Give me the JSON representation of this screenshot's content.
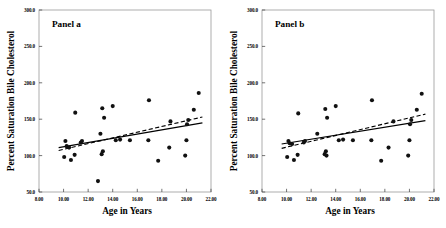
{
  "figure": {
    "background": "#ffffff",
    "point_color": "#111111",
    "frame_color": "#9a9a9a"
  },
  "chart_data": [
    {
      "type": "scatter",
      "title": "Panel a",
      "xlabel": "Age in Years",
      "ylabel": "Percent Saturation Bile Cholesterol",
      "xlim": [
        8.0,
        22.0
      ],
      "ylim": [
        50.0,
        300.0
      ],
      "xticks": [
        8.0,
        10.0,
        12.0,
        14.0,
        16.0,
        18.0,
        20.0,
        22.0
      ],
      "xtick_labels": [
        "8.00",
        "10.00",
        "12.00",
        "14.00",
        "16.00",
        "18.00",
        "20.00",
        "22.00"
      ],
      "yticks": [
        50.0,
        100.0,
        150.0,
        200.0,
        250.0,
        300.0
      ],
      "ytick_labels": [
        "50.0",
        "100.0",
        "150.0",
        "200.0",
        "250.0",
        "300.0"
      ],
      "grid": false,
      "legend": "none",
      "points": [
        [
          10.05,
          98
        ],
        [
          10.15,
          120
        ],
        [
          10.25,
          113
        ],
        [
          10.45,
          111
        ],
        [
          10.6,
          94
        ],
        [
          10.9,
          101
        ],
        [
          10.95,
          159
        ],
        [
          11.4,
          118
        ],
        [
          11.5,
          120
        ],
        [
          12.8,
          65
        ],
        [
          13.0,
          130
        ],
        [
          13.1,
          102
        ],
        [
          13.15,
          165
        ],
        [
          13.2,
          106
        ],
        [
          13.3,
          152
        ],
        [
          14.0,
          168
        ],
        [
          14.25,
          121
        ],
        [
          14.6,
          122
        ],
        [
          15.4,
          121
        ],
        [
          16.9,
          121
        ],
        [
          16.95,
          176
        ],
        [
          17.7,
          93
        ],
        [
          18.6,
          111
        ],
        [
          18.7,
          147
        ],
        [
          19.9,
          100
        ],
        [
          20.0,
          121
        ],
        [
          20.05,
          143
        ],
        [
          20.15,
          149
        ],
        [
          20.6,
          163
        ],
        [
          21.0,
          186
        ]
      ],
      "fit_solid": {
        "style": "solid",
        "x": [
          9.6,
          21.3
        ],
        "y": [
          111,
          145
        ]
      },
      "fit_dashed": {
        "style": "dashed",
        "x": [
          9.6,
          21.3
        ],
        "y": [
          107,
          153
        ]
      }
    },
    {
      "type": "scatter",
      "title": "Panel b",
      "xlabel": "Age in Years",
      "ylabel": "Percent Saturation Bile Cholesterol",
      "xlim": [
        8.0,
        22.0
      ],
      "ylim": [
        50.0,
        300.0
      ],
      "xticks": [
        8.0,
        10.0,
        12.0,
        14.0,
        16.0,
        18.0,
        20.0,
        22.0
      ],
      "xtick_labels": [
        "8.00",
        "10.00",
        "12.00",
        "14.00",
        "16.00",
        "18.00",
        "20.00",
        "22.00"
      ],
      "yticks": [
        50.0,
        100.0,
        150.0,
        200.0,
        250.0,
        300.0
      ],
      "ytick_labels": [
        "50.0",
        "100.0",
        "150.0",
        "200.0",
        "250.0",
        "300.0"
      ],
      "grid": false,
      "legend": "none",
      "points": [
        [
          10.05,
          98
        ],
        [
          10.15,
          120
        ],
        [
          10.25,
          117
        ],
        [
          10.45,
          116
        ],
        [
          10.6,
          94
        ],
        [
          10.9,
          101
        ],
        [
          10.95,
          158
        ],
        [
          11.4,
          118
        ],
        [
          11.5,
          120
        ],
        [
          12.5,
          130
        ],
        [
          13.1,
          102
        ],
        [
          13.15,
          164
        ],
        [
          13.2,
          106
        ],
        [
          13.25,
          100
        ],
        [
          13.3,
          152
        ],
        [
          14.0,
          168
        ],
        [
          14.25,
          121
        ],
        [
          14.6,
          122
        ],
        [
          15.4,
          121
        ],
        [
          16.9,
          121
        ],
        [
          16.95,
          176
        ],
        [
          17.7,
          93
        ],
        [
          18.3,
          111
        ],
        [
          18.7,
          147
        ],
        [
          19.9,
          100
        ],
        [
          20.0,
          121
        ],
        [
          20.05,
          143
        ],
        [
          20.15,
          149
        ],
        [
          20.6,
          163
        ],
        [
          21.0,
          185
        ]
      ],
      "fit_solid": {
        "style": "solid",
        "x": [
          9.6,
          21.3
        ],
        "y": [
          116,
          148
        ]
      },
      "fit_dashed": {
        "style": "dashed",
        "x": [
          9.6,
          21.3
        ],
        "y": [
          110,
          157
        ]
      }
    }
  ]
}
